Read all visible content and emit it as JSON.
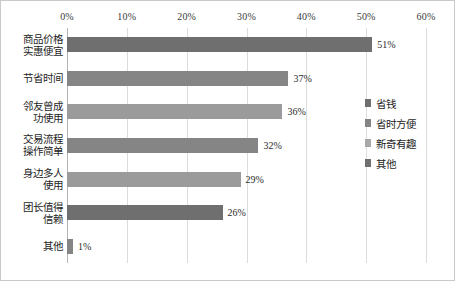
{
  "chart_data": {
    "type": "bar",
    "orientation": "horizontal",
    "title": "",
    "xlabel": "",
    "ylabel": "",
    "xlim": [
      0,
      60
    ],
    "xticks": [
      "0%",
      "10%",
      "20%",
      "30%",
      "40%",
      "50%",
      "60%"
    ],
    "xtick_values": [
      0,
      10,
      20,
      30,
      40,
      50,
      60
    ],
    "grid": true,
    "legend_position": "right",
    "categories": [
      "商品价格\n实惠便宜",
      "节省时间",
      "邻友曾成\n功使用",
      "交易流程\n操作简单",
      "身边多人\n使用",
      "团长值得\n信赖",
      "其他"
    ],
    "values": [
      51,
      37,
      36,
      32,
      29,
      26,
      1
    ],
    "value_labels": [
      "51%",
      "37%",
      "36%",
      "32%",
      "29%",
      "26%",
      "1%"
    ],
    "bar_colors": [
      "#6f6f6f",
      "#858585",
      "#9b9b9b",
      "#858585",
      "#9b9b9b",
      "#6f6f6f",
      "#858585"
    ],
    "legend": [
      {
        "label": "省钱",
        "color": "#6f6f6f"
      },
      {
        "label": "省时方便",
        "color": "#858585"
      },
      {
        "label": "新奇有趣",
        "color": "#a8a8a8"
      },
      {
        "label": "其他",
        "color": "#6f6f6f"
      }
    ],
    "colors": {
      "gridline": "#dcdcdc",
      "axis": "#b4b4b4",
      "border": "#c9c9c9",
      "text": "#1e1e1e",
      "background": "#ffffff"
    }
  }
}
